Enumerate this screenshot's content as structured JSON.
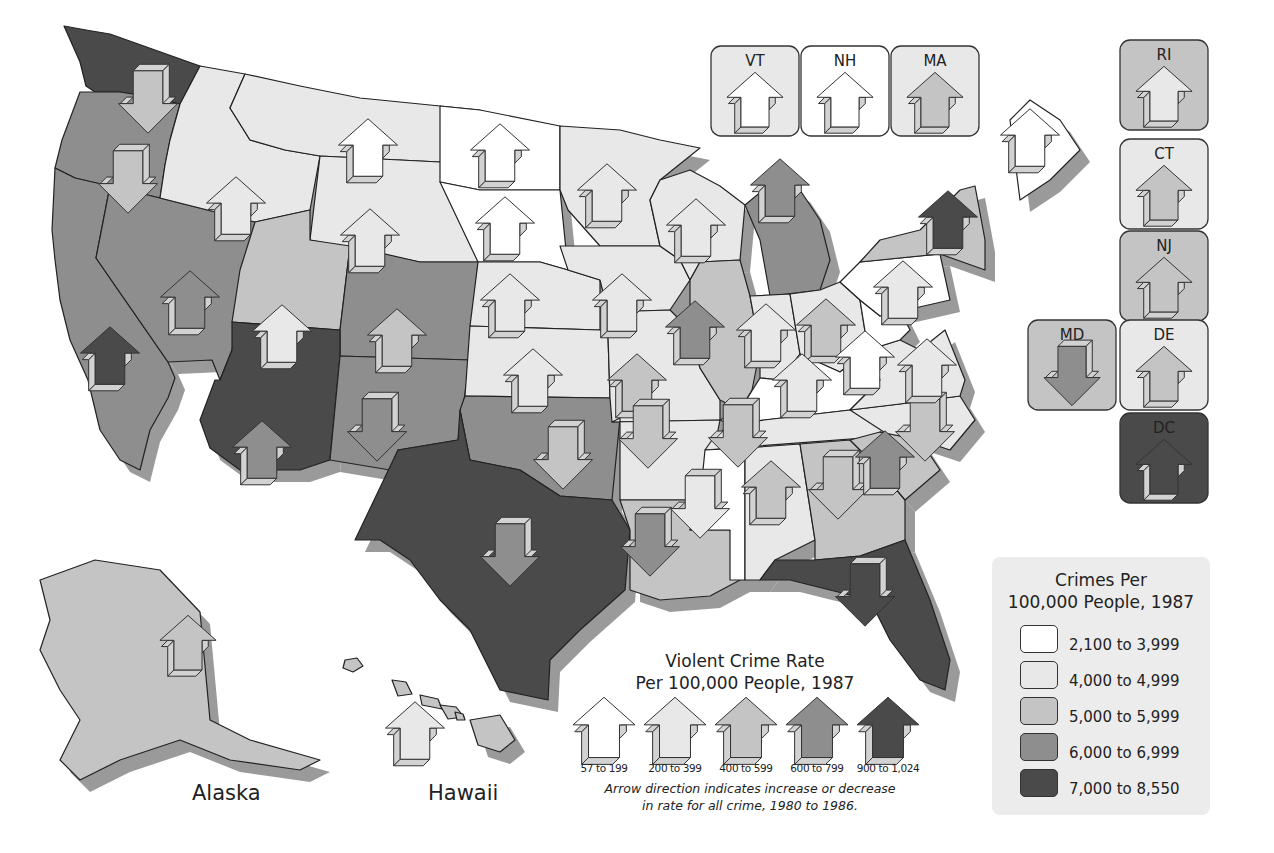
{
  "title_crimes_legend": [
    "Crimes Per",
    "100,000 People, 1987"
  ],
  "crime_classes": [
    {
      "id": "c1",
      "label": "2,100 to 3,999",
      "color": "#ffffff"
    },
    {
      "id": "c2",
      "label": "4,000 to 4,999",
      "color": "#e8e8e8"
    },
    {
      "id": "c3",
      "label": "5,000 to 5,999",
      "color": "#c4c4c4"
    },
    {
      "id": "c4",
      "label": "6,000 to 6,999",
      "color": "#8e8e8e"
    },
    {
      "id": "c5",
      "label": "7,000 to 8,550",
      "color": "#4a4a4a"
    }
  ],
  "violent_legend": {
    "title": [
      "Violent Crime Rate",
      "Per 100,000 People, 1987"
    ],
    "classes": [
      {
        "id": "v1",
        "label": "57 to 199",
        "color": "#ffffff"
      },
      {
        "id": "v2",
        "label": "200 to 399",
        "color": "#e8e8e8"
      },
      {
        "id": "v3",
        "label": "400 to 599",
        "color": "#c4c4c4"
      },
      {
        "id": "v4",
        "label": "600 to 799",
        "color": "#8e8e8e"
      },
      {
        "id": "v5",
        "label": "900 to 1,024",
        "color": "#4a4a4a"
      }
    ],
    "note": [
      "Arrow direction indicates increase or decrease",
      "in rate for all crime, 1980 to 1986."
    ]
  },
  "region_labels": {
    "alaska": "Alaska",
    "hawaii": "Hawaii"
  },
  "states": [
    {
      "abbr": "WA",
      "crime": "c5",
      "violent": "v3",
      "direction": "down"
    },
    {
      "abbr": "OR",
      "crime": "c4",
      "violent": "v3",
      "direction": "down"
    },
    {
      "abbr": "CA",
      "crime": "c4",
      "violent": "v5",
      "direction": "up"
    },
    {
      "abbr": "NV",
      "crime": "c4",
      "violent": "v4",
      "direction": "up"
    },
    {
      "abbr": "ID",
      "crime": "c2",
      "violent": "v2",
      "direction": "up"
    },
    {
      "abbr": "MT",
      "crime": "c2",
      "violent": "v1",
      "direction": "up"
    },
    {
      "abbr": "WY",
      "crime": "c2",
      "violent": "v2",
      "direction": "up"
    },
    {
      "abbr": "UT",
      "crime": "c3",
      "violent": "v2",
      "direction": "up"
    },
    {
      "abbr": "CO",
      "crime": "c4",
      "violent": "v3",
      "direction": "up"
    },
    {
      "abbr": "AZ",
      "crime": "c5",
      "violent": "v4",
      "direction": "up"
    },
    {
      "abbr": "NM",
      "crime": "c4",
      "violent": "v4",
      "direction": "down"
    },
    {
      "abbr": "ND",
      "crime": "c1",
      "violent": "v1",
      "direction": "up"
    },
    {
      "abbr": "SD",
      "crime": "c1",
      "violent": "v1",
      "direction": "up"
    },
    {
      "abbr": "NE",
      "crime": "c2",
      "violent": "v2",
      "direction": "up"
    },
    {
      "abbr": "KS",
      "crime": "c2",
      "violent": "v2",
      "direction": "up"
    },
    {
      "abbr": "OK",
      "crime": "c4",
      "violent": "v3",
      "direction": "down"
    },
    {
      "abbr": "TX",
      "crime": "c5",
      "violent": "v4",
      "direction": "down"
    },
    {
      "abbr": "MN",
      "crime": "c2",
      "violent": "v2",
      "direction": "up"
    },
    {
      "abbr": "IA",
      "crime": "c2",
      "violent": "v2",
      "direction": "up"
    },
    {
      "abbr": "MO",
      "crime": "c2",
      "violent": "v3",
      "direction": "up"
    },
    {
      "abbr": "AR",
      "crime": "c2",
      "violent": "v3",
      "direction": "down"
    },
    {
      "abbr": "LA",
      "crime": "c3",
      "violent": "v4",
      "direction": "down"
    },
    {
      "abbr": "WI",
      "crime": "c2",
      "violent": "v2",
      "direction": "up"
    },
    {
      "abbr": "IL",
      "crime": "c3",
      "violent": "v4",
      "direction": "up"
    },
    {
      "abbr": "MI",
      "crime": "c4",
      "violent": "v4",
      "direction": "up"
    },
    {
      "abbr": "IN",
      "crime": "c2",
      "violent": "v2",
      "direction": "up"
    },
    {
      "abbr": "OH",
      "crime": "c2",
      "violent": "v3",
      "direction": "up"
    },
    {
      "abbr": "KY",
      "crime": "c1",
      "violent": "v2",
      "direction": "up"
    },
    {
      "abbr": "TN",
      "crime": "c2",
      "violent": "v3",
      "direction": "down"
    },
    {
      "abbr": "MS",
      "crime": "c1",
      "violent": "v2",
      "direction": "down"
    },
    {
      "abbr": "AL",
      "crime": "c2",
      "violent": "v3",
      "direction": "up"
    },
    {
      "abbr": "GA",
      "crime": "c3",
      "violent": "v3",
      "direction": "down"
    },
    {
      "abbr": "FL",
      "crime": "c5",
      "violent": "v5",
      "direction": "down"
    },
    {
      "abbr": "SC",
      "crime": "c3",
      "violent": "v4",
      "direction": "up"
    },
    {
      "abbr": "NC",
      "crime": "c2",
      "violent": "v3",
      "direction": "down"
    },
    {
      "abbr": "VA",
      "crime": "c2",
      "violent": "v2",
      "direction": "up"
    },
    {
      "abbr": "WV",
      "crime": "c1",
      "violent": "v1",
      "direction": "up"
    },
    {
      "abbr": "PA",
      "crime": "c1",
      "violent": "v2",
      "direction": "up"
    },
    {
      "abbr": "NY",
      "crime": "c3",
      "violent": "v5",
      "direction": "up"
    },
    {
      "abbr": "ME",
      "crime": "c1",
      "violent": "v1",
      "direction": "up"
    },
    {
      "abbr": "AK",
      "crime": "c3",
      "violent": "v3",
      "direction": "up"
    },
    {
      "abbr": "HI",
      "crime": "c3",
      "violent": "v2",
      "direction": "up"
    }
  ],
  "small_states": [
    {
      "abbr": "VT",
      "crime": "c2",
      "violent": "v1",
      "direction": "up"
    },
    {
      "abbr": "NH",
      "crime": "c1",
      "violent": "v1",
      "direction": "up"
    },
    {
      "abbr": "MA",
      "crime": "c2",
      "violent": "v3",
      "direction": "up"
    },
    {
      "abbr": "RI",
      "crime": "c3",
      "violent": "v2",
      "direction": "up"
    },
    {
      "abbr": "CT",
      "crime": "c2",
      "violent": "v3",
      "direction": "up"
    },
    {
      "abbr": "NJ",
      "crime": "c3",
      "violent": "v3",
      "direction": "up"
    },
    {
      "abbr": "MD",
      "crime": "c3",
      "violent": "v4",
      "direction": "down"
    },
    {
      "abbr": "DE",
      "crime": "c2",
      "violent": "v3",
      "direction": "up"
    },
    {
      "abbr": "DC",
      "crime": "c5",
      "violent": "v5",
      "direction": "up"
    }
  ]
}
